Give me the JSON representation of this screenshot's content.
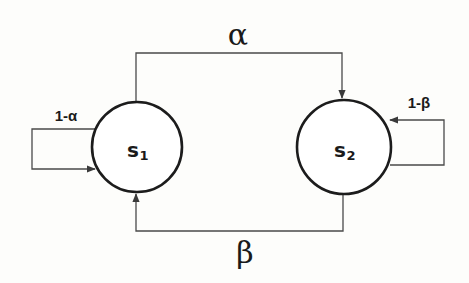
{
  "diagram": {
    "type": "markov-chain",
    "nodes": [
      {
        "id": "s1",
        "label": "s",
        "subscript": "1"
      },
      {
        "id": "s2",
        "label": "s",
        "subscript": "2"
      }
    ],
    "edges": [
      {
        "from": "s1",
        "to": "s2",
        "label": "α"
      },
      {
        "from": "s2",
        "to": "s1",
        "label": "β"
      },
      {
        "from": "s1",
        "to": "s1",
        "label": "1-α"
      },
      {
        "from": "s2",
        "to": "s2",
        "label": "1-β"
      }
    ],
    "colors": {
      "line": "#4a4a4a",
      "node_stroke": "#1c1c1c",
      "text": "#1a1a1a",
      "background": "#fdfdfb"
    }
  }
}
